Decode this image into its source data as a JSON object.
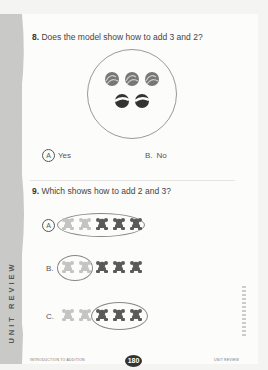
{
  "side_tab": {
    "label": "UNIT REVIEW"
  },
  "question8": {
    "number": "8.",
    "text": "Does the model show how to add 3 and 2?",
    "model": {
      "top_count": 3,
      "bottom_count": 2
    },
    "options": [
      {
        "letter": "A",
        "label": "Yes",
        "selected": true
      },
      {
        "letter": "B.",
        "label": "No",
        "selected": false
      }
    ]
  },
  "question9": {
    "number": "9.",
    "text": "Which shows how to add 2 and 3?",
    "options": [
      {
        "letter": "A",
        "selected": true,
        "light_bears": 2,
        "dark_bears": 3,
        "circled": "all"
      },
      {
        "letter": "B.",
        "selected": false,
        "light_bears": 2,
        "dark_bears": 3,
        "circled": "light"
      },
      {
        "letter": "C.",
        "selected": false,
        "light_bears": 2,
        "dark_bears": 3,
        "circled": "dark"
      }
    ]
  },
  "footer": {
    "left": "INTRODUCTION TO ADDITION",
    "page_number": "180",
    "right": "UNIT REVIEW"
  },
  "colors": {
    "light_bear": "#c4c4c2",
    "dark_bear": "#5a5a5a",
    "strip": "#c9c9c7"
  }
}
